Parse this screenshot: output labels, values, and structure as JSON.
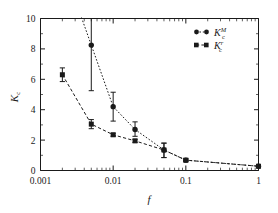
{
  "chart_data": {
    "type": "line",
    "title": "",
    "xlabel": "f",
    "ylabel": "K_c",
    "xscale": "log",
    "yscale": "linear",
    "xlim": [
      0.001,
      1
    ],
    "ylim": [
      0,
      10
    ],
    "grid": false,
    "legend_position": "top-right",
    "x_tick_labels": [
      "0.001",
      "0.01",
      "0.1",
      "1"
    ],
    "x_tick_values": [
      0.001,
      0.01,
      0.1,
      1
    ],
    "y_tick_labels": [
      "0",
      "2",
      "4",
      "6",
      "8",
      "10"
    ],
    "y_tick_values": [
      0,
      2,
      4,
      6,
      8,
      10
    ],
    "series": [
      {
        "name": "K_c^M",
        "label_base": "K",
        "label_sub": "c",
        "label_sup": "M",
        "marker": "circle",
        "linestyle": "dotted",
        "x": [
          0.005,
          0.01,
          0.02,
          0.05,
          0.1,
          1.0
        ],
        "values": [
          8.25,
          4.2,
          2.7,
          1.35,
          0.68,
          0.28
        ],
        "err_low": [
          3.0,
          0.95,
          0.45,
          0.5,
          0.1,
          0.08
        ],
        "err_high": [
          3.2,
          0.95,
          0.5,
          0.45,
          0.1,
          0.08
        ]
      },
      {
        "name": "K_c^r",
        "label_base": "K",
        "label_sub": "c",
        "label_sup": "r",
        "marker": "square",
        "linestyle": "dashed",
        "x": [
          0.002,
          0.005,
          0.01,
          0.02,
          0.05,
          0.1,
          1.0
        ],
        "values": [
          6.3,
          3.05,
          2.35,
          1.95,
          1.35,
          0.68,
          0.28
        ],
        "err_low": [
          0.45,
          0.3,
          0.1,
          0.1,
          0.5,
          0.08,
          0.08
        ],
        "err_high": [
          0.45,
          0.3,
          0.1,
          0.1,
          0.45,
          0.08,
          0.08
        ]
      }
    ],
    "colors": {
      "ink": "#1a1a1a",
      "background": "#ffffff"
    }
  }
}
